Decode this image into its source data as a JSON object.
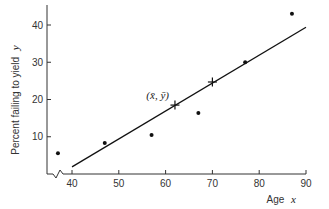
{
  "chart_data": {
    "type": "scatter",
    "title": "",
    "xlabel": "Age",
    "xlabel_var": "x",
    "ylabel": "Percent failing to yield",
    "ylabel_var": "y",
    "xlim": [
      35,
      90
    ],
    "ylim": [
      0,
      45
    ],
    "x_axis_break": true,
    "grid": false,
    "legend": null,
    "x_ticks": [
      40,
      50,
      60,
      70,
      80,
      90
    ],
    "y_ticks": [
      10,
      20,
      30,
      40
    ],
    "series": [
      {
        "name": "Observed data",
        "kind": "scatter",
        "x": [
          37,
          47,
          57,
          67,
          77,
          87
        ],
        "y": [
          5.6,
          8.3,
          10.5,
          16.4,
          30,
          43
        ]
      },
      {
        "name": "Fitted regression line",
        "kind": "line",
        "x": [
          40,
          90
        ],
        "y": [
          1.9,
          39.4
        ]
      },
      {
        "name": "Marked points on line",
        "kind": "cross",
        "x": [
          62,
          70
        ],
        "y": [
          18.5,
          24.7
        ]
      }
    ],
    "annotations": [
      {
        "text": "(x̄, ȳ)",
        "x": 62,
        "y": 18.5,
        "position": "upper-left"
      }
    ]
  },
  "layout": {
    "x_px": {
      "v0": 40,
      "p0": 72,
      "v1": 90,
      "p1": 306
    },
    "y_px": {
      "v0": 0,
      "p0": 174,
      "v1": 40,
      "p1": 25
    },
    "axis_left": 47,
    "axis_top": 5,
    "axis_right": 306
  }
}
